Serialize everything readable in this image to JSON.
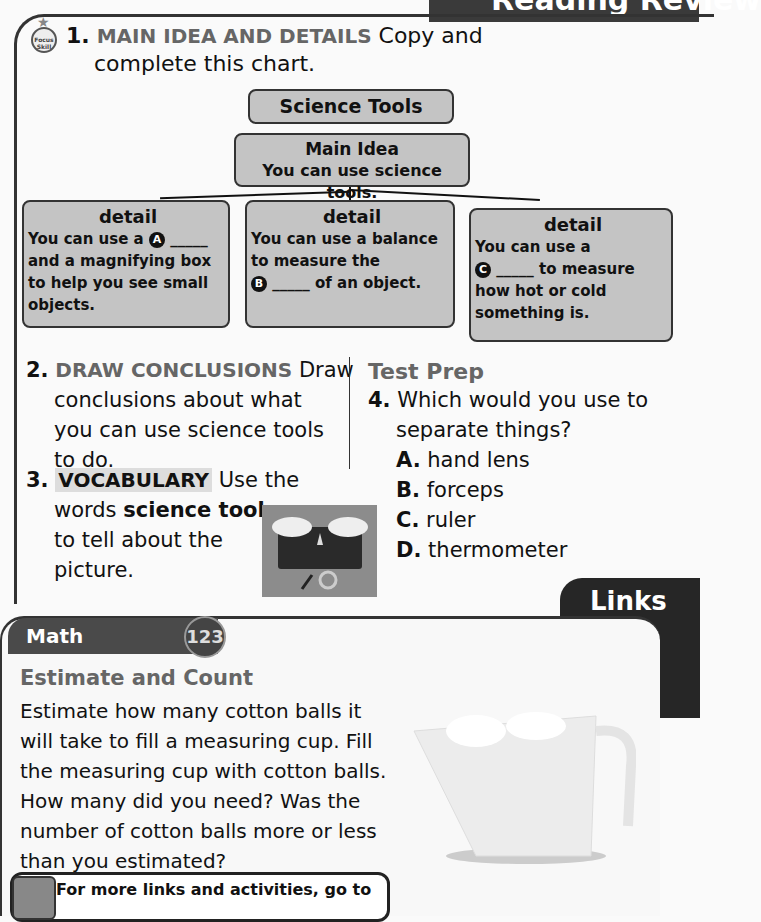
{
  "header": {
    "section_tab": "Reading Review"
  },
  "question1": {
    "badge": {
      "line1": "Focus",
      "line2": "Skill"
    },
    "number": "1.",
    "skill": "MAIN IDEA AND DETAILS",
    "line1_rest": "Copy and",
    "line2": "complete this chart.",
    "chart": {
      "title": "Science Tools",
      "main_idea": {
        "heading": "Main Idea",
        "text": "You can use science tools."
      },
      "details": [
        {
          "heading": "detail",
          "lines": [
            "You can use a",
            "and a magnifying box",
            "to help you see small",
            "objects."
          ],
          "marker": "A",
          "blank": "_____"
        },
        {
          "heading": "detail",
          "lines": [
            "You can use a balance",
            "to measure the",
            "of an object."
          ],
          "marker": "B",
          "blank": "_____"
        },
        {
          "heading": "detail",
          "lines": [
            "You can use a",
            "to measure",
            "how hot or cold",
            "something is."
          ],
          "marker": "C",
          "blank": "_____"
        }
      ]
    }
  },
  "question2": {
    "number": "2.",
    "skill": "DRAW CONCLUSIONS",
    "lines": [
      "Draw",
      "conclusions about what",
      "you can use science tools",
      "to do."
    ]
  },
  "question3": {
    "number": "3.",
    "skill": "VOCABULARY",
    "lines": [
      "Use the",
      "words",
      "science tools",
      "to tell about the",
      "picture."
    ]
  },
  "test_prep": {
    "title": "Test Prep",
    "number": "4.",
    "question_lines": [
      "Which would you use to",
      "separate things?"
    ],
    "options": [
      {
        "letter": "A.",
        "text": "hand lens"
      },
      {
        "letter": "B.",
        "text": "forceps"
      },
      {
        "letter": "C.",
        "text": "ruler"
      },
      {
        "letter": "D.",
        "text": "thermometer"
      }
    ]
  },
  "links": {
    "tab": "Links",
    "math": {
      "header": "Math",
      "badge": "123",
      "title": "Estimate and Count",
      "body_lines": [
        "Estimate how many cotton balls it",
        "will take to fill a measuring cup. Fill",
        "the measuring cup with cotton balls.",
        "How many did you need? Was the",
        "number of cotton balls more or less",
        "than you estimated?"
      ]
    },
    "more": "For more links and activities, go to"
  }
}
